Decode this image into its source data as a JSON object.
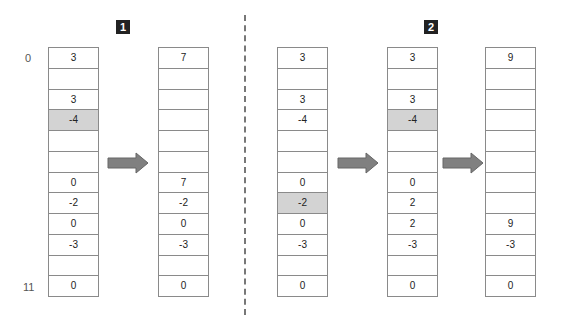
{
  "panels": [
    {
      "label": "1",
      "badge_x": 116
    },
    {
      "label": "2",
      "badge_x": 424
    }
  ],
  "index_labels": {
    "top": "0",
    "bottom": "11"
  },
  "colors": {
    "highlight": "#d3d3d3",
    "arrow": "#808080",
    "badge": "#222222"
  },
  "columns": [
    {
      "name": "panel1-before",
      "x": 48,
      "cells": [
        "3",
        "",
        "3",
        "-4",
        "",
        "",
        "0",
        "-2",
        "0",
        "-3",
        "",
        "0"
      ],
      "highlight": [
        3
      ]
    },
    {
      "name": "panel1-after",
      "x": 158,
      "cells": [
        "7",
        "",
        "",
        "",
        "",
        "",
        "7",
        "-2",
        "0",
        "-3",
        "",
        "0"
      ],
      "highlight": []
    },
    {
      "name": "panel2-step0",
      "x": 277,
      "cells": [
        "3",
        "",
        "3",
        "-4",
        "",
        "",
        "0",
        "-2",
        "0",
        "-3",
        "",
        "0"
      ],
      "highlight": [
        7
      ]
    },
    {
      "name": "panel2-step1",
      "x": 387,
      "cells": [
        "3",
        "",
        "3",
        "-4",
        "",
        "",
        "0",
        "2",
        "2",
        "-3",
        "",
        "0"
      ],
      "highlight": [
        3
      ]
    },
    {
      "name": "panel2-step2",
      "x": 485,
      "cells": [
        "9",
        "",
        "",
        "",
        "",
        "",
        "",
        "",
        "9",
        "-3",
        "",
        "0"
      ],
      "highlight": []
    }
  ],
  "arrows": [
    {
      "x": 107,
      "y": 152
    },
    {
      "x": 337,
      "y": 152
    },
    {
      "x": 442,
      "y": 152
    }
  ]
}
